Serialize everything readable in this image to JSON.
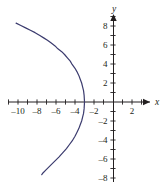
{
  "figure": {
    "width": 167,
    "height": 187,
    "background": "#ffffff",
    "axis_color": "#231f20",
    "curve_color": "#3b3b6e"
  },
  "axes": {
    "x_axis_label": "x",
    "y_axis_label": "y",
    "origin_px": {
      "x": 113,
      "y": 102
    },
    "unit_px": 9.5,
    "x_tick_labels": [
      "–10",
      "–8",
      "–6",
      "–4",
      "–2",
      "2"
    ],
    "x_tick_values": [
      -10,
      -8,
      -6,
      -4,
      -2,
      2
    ],
    "y_tick_labels": [
      "8",
      "6",
      "4",
      "2",
      "–2",
      "–4",
      "–6",
      "–8"
    ],
    "y_tick_values": [
      8,
      6,
      4,
      2,
      -2,
      -4,
      -6,
      -8
    ],
    "x_minor_ticks": [
      -11,
      -10,
      -9,
      -8,
      -7,
      -6,
      -5,
      -4,
      -3,
      -2,
      -1,
      1,
      2,
      3
    ],
    "y_minor_ticks": [
      9,
      8,
      7,
      6,
      5,
      4,
      3,
      2,
      1,
      -1,
      -2,
      -3,
      -4,
      -5,
      -6,
      -7,
      -8,
      -9
    ]
  },
  "chart_data": {
    "type": "line",
    "title": "",
    "xlabel": "x",
    "ylabel": "y",
    "xlim": [
      -11.5,
      4.2
    ],
    "ylim": [
      -9,
      9.3
    ],
    "grid": false,
    "legend": "none",
    "series": [
      {
        "name": "parabola",
        "equation": "x = -3 - y^2/10",
        "color": "#3b3b6e",
        "orientation": "opens-left",
        "vertex": [
          -3,
          0
        ],
        "x": [
          -10.2,
          -9.7,
          -9.2,
          -8.7,
          -8.2,
          -7.7,
          -7.3,
          -6.9,
          -6.5,
          -6.1,
          -5.8,
          -5.4,
          -5.1,
          -4.8,
          -4.5,
          -4.3,
          -4.0,
          -3.8,
          -3.6,
          -3.45,
          -3.3,
          -3.2,
          -3.1,
          -3.04,
          -3.0,
          -3.04,
          -3.1,
          -3.2,
          -3.3,
          -3.45,
          -3.6,
          -3.8,
          -4.0,
          -4.3,
          -4.6,
          -4.9,
          -5.3,
          -5.7,
          -6.1,
          -6.5,
          -7.0,
          -7.4,
          -7.5
        ],
        "y": [
          8.3,
          8.05,
          7.8,
          7.55,
          7.3,
          7.0,
          6.75,
          6.5,
          6.2,
          5.9,
          5.6,
          5.3,
          5.0,
          4.65,
          4.3,
          3.95,
          3.55,
          3.2,
          2.8,
          2.4,
          2.0,
          1.6,
          1.2,
          0.7,
          0.0,
          -0.7,
          -1.2,
          -1.6,
          -2.0,
          -2.4,
          -2.8,
          -3.2,
          -3.6,
          -4.1,
          -4.5,
          -4.9,
          -5.35,
          -5.8,
          -6.2,
          -6.6,
          -7.1,
          -7.5,
          -7.65
        ]
      }
    ]
  }
}
